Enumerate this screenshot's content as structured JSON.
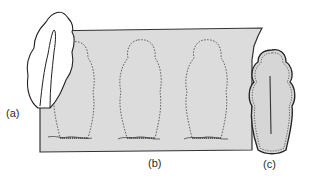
{
  "diagram": {
    "labels": {
      "a": "(a)",
      "b": "(b)",
      "c": "(c)"
    },
    "parts": [
      {
        "id": "a",
        "description": "white folded piece with central slit, placed over left end of sheet"
      },
      {
        "id": "b",
        "description": "gray sheet with three dashed template outlines"
      },
      {
        "id": "c",
        "description": "finished cut-out piece with dashed seam and center slit"
      }
    ],
    "colors": {
      "sheet_fill": "#dcdcdc",
      "piece_fill": "#d6d6d6",
      "outline": "#333333",
      "white_piece": "#ffffff"
    }
  }
}
